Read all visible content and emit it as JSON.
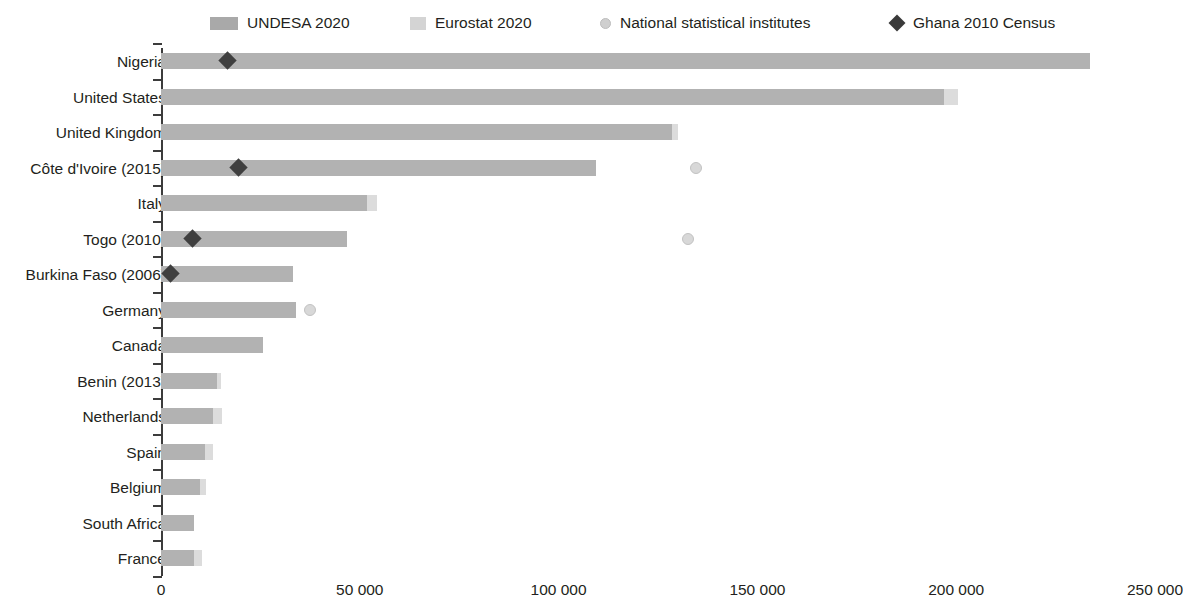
{
  "legend": {
    "items": [
      {
        "label": "UNDESA 2020",
        "marker": "bar-swatch-dark"
      },
      {
        "label": "Eurostat 2020",
        "marker": "bar-swatch-light"
      },
      {
        "label": "National statistical institutes",
        "marker": "circle-marker"
      },
      {
        "label": "Ghana 2010 Census",
        "marker": "diamond-marker"
      }
    ]
  },
  "colors": {
    "undesa": "#b2b2b2",
    "eurostat": "#dcdcdc",
    "nsi": "#d8d8d8",
    "ghana": "#3f3f3f",
    "axis": "#3c3c3c",
    "text": "#231f20"
  },
  "chart_data": {
    "type": "bar",
    "orientation": "horizontal",
    "title": "",
    "xlabel": "",
    "ylabel": "",
    "xlim": [
      0,
      250000
    ],
    "xticks": [
      0,
      50000,
      100000,
      150000,
      200000,
      250000
    ],
    "xtick_labels": [
      "0",
      "50 000",
      "100 000",
      "150 000",
      "200 000",
      "250 000"
    ],
    "grid": false,
    "legend_position": "top",
    "categories": [
      "Nigeria",
      "United States",
      "United Kingdom",
      "Côte d'Ivoire (2015)",
      "Italy",
      "Togo (2010)",
      "Burkina Faso (2006)",
      "Germany",
      "Canada",
      "Benin (2013)",
      "Netherlands",
      "Spain",
      "Belgium",
      "South Africa",
      "France"
    ],
    "series": [
      {
        "name": "UNDESA 2020",
        "type": "bar",
        "values": [
          233700,
          197000,
          128500,
          109400,
          51800,
          46800,
          33200,
          33900,
          25700,
          14000,
          13100,
          11000,
          9800,
          8300,
          8300
        ]
      },
      {
        "name": "Eurostat 2020",
        "type": "bar-extension",
        "values": [
          null,
          200500,
          130000,
          null,
          54300,
          null,
          null,
          null,
          null,
          15200,
          15400,
          13000,
          11300,
          null,
          10200
        ]
      },
      {
        "name": "National statistical institutes",
        "type": "scatter",
        "values": [
          null,
          null,
          null,
          134500,
          null,
          132500,
          null,
          37500,
          null,
          null,
          null,
          null,
          null,
          null,
          null
        ]
      },
      {
        "name": "Ghana 2010 Census",
        "type": "scatter",
        "values": [
          16600,
          null,
          null,
          19600,
          null,
          8000,
          2400,
          null,
          null,
          null,
          null,
          null,
          null,
          null,
          null
        ]
      }
    ]
  }
}
